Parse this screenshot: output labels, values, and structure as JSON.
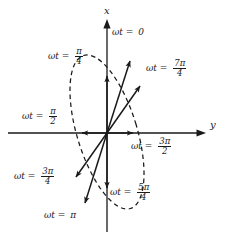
{
  "figure": {
    "type": "phasor-ellipse-diagram",
    "axes": {
      "vertical_label": "x",
      "horizontal_label": "y",
      "origin": [
        107,
        133
      ]
    },
    "stroke_color": "#1a1a1a",
    "background_color": "#ffffff"
  },
  "labels": [
    {
      "id": "wt-0",
      "prefix": "ωt =",
      "value": "0",
      "type": "plain",
      "num": "",
      "den": "",
      "x": 112,
      "y": 33
    },
    {
      "id": "wt-pi4",
      "prefix": "ωt =",
      "value": "",
      "type": "frac",
      "num": "π",
      "den": "4",
      "x": 50,
      "y": 52
    },
    {
      "id": "wt-7pi4",
      "prefix": "ωt =",
      "value": "",
      "type": "frac",
      "num": "7π",
      "den": "4",
      "x": 148,
      "y": 64
    },
    {
      "id": "wt-pi2",
      "prefix": "ωt =",
      "value": "",
      "type": "frac",
      "num": "π",
      "den": "2",
      "x": 23,
      "y": 112
    },
    {
      "id": "wt-3pi2",
      "prefix": "ωt =",
      "value": "",
      "type": "frac",
      "num": "3π",
      "den": "2",
      "x": 133,
      "y": 141
    },
    {
      "id": "wt-3pi4",
      "prefix": "ωt =",
      "value": "",
      "type": "frac",
      "num": "3π",
      "den": "4",
      "x": 16,
      "y": 172
    },
    {
      "id": "wt-5pi4",
      "prefix": "ωt =",
      "value": "",
      "type": "frac",
      "num": "5π",
      "den": "4",
      "x": 111,
      "y": 188
    },
    {
      "id": "wt-pi",
      "prefix": "ωt =",
      "value": "π",
      "type": "plain",
      "num": "",
      "den": "",
      "x": 45,
      "y": 213
    }
  ],
  "axis_labels": [
    {
      "id": "x-axis-label",
      "text": "x",
      "x": 107,
      "y": 8
    },
    {
      "id": "y-axis-label",
      "text": "y",
      "x": 211,
      "y": 124
    }
  ],
  "vectors": [
    {
      "id": "vector-wt-0",
      "angle_label": "0",
      "tip": [
        131,
        58
      ]
    },
    {
      "id": "vector-wt-pi4",
      "angle_label": "pi/4",
      "tip": [
        107,
        72
      ]
    },
    {
      "id": "vector-wt-pi2",
      "angle_label": "pi/2",
      "tip": [
        78,
        133
      ]
    },
    {
      "id": "vector-wt-3pi4",
      "angle_label": "3pi/4",
      "tip": [
        73,
        180
      ]
    },
    {
      "id": "vector-wt-pi",
      "angle_label": "pi",
      "tip": [
        83,
        207
      ]
    },
    {
      "id": "vector-wt-5pi4",
      "angle_label": "5pi/4",
      "tip": [
        107,
        192
      ]
    },
    {
      "id": "vector-wt-3pi2",
      "angle_label": "3pi/2",
      "tip": [
        137,
        133
      ]
    },
    {
      "id": "vector-wt-7pi4",
      "angle_label": "7pi/4",
      "tip": [
        142,
        82
      ]
    }
  ],
  "ellipse": {
    "id": "polarization-ellipse",
    "style": "dashed",
    "center": [
      107,
      132
    ],
    "semi_major": 80,
    "semi_minor": 30,
    "rotation_deg": -17
  }
}
